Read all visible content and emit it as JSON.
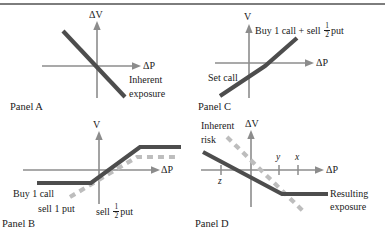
{
  "figure": {
    "kind": "option-payoff-diagram",
    "colors": {
      "axis": "#8c8c8c",
      "solid_line": "#4d4d4d",
      "dashed_line": "#bdbdbd",
      "text": "#1a1a1a",
      "rule": "#7d7d7d",
      "background": "#ffffff"
    },
    "top_rule": true
  },
  "panels": [
    {
      "id": "panel-a",
      "caption": "Panel A",
      "y_axis_label": "ΔV",
      "x_axis_label": "ΔP",
      "annotations": [
        {
          "name": "inherent-exposure",
          "line1": "Inherent",
          "line2": "exposure"
        }
      ],
      "curves": [
        {
          "name": "inherent-exposure-line",
          "style": "solid",
          "shape": "downward-sloping-straight"
        }
      ]
    },
    {
      "id": "panel-c",
      "caption": "Panel C",
      "y_axis_label": "V",
      "x_axis_label": "ΔP",
      "annotations": [
        {
          "name": "buy-call-sell-half-put",
          "prefix": "Buy 1 call + sell ",
          "fraction_num": "1",
          "fraction_den": "2",
          "suffix": "put"
        },
        {
          "name": "set-call",
          "text": "Set call"
        }
      ],
      "curves": [
        {
          "name": "payoff-line",
          "style": "solid",
          "shape": "kinked-upward"
        }
      ]
    },
    {
      "id": "panel-b",
      "caption": "Panel B",
      "y_axis_label": "V",
      "x_axis_label": "ΔP",
      "annotations": [
        {
          "name": "buy-1-call",
          "text": "Buy 1 call"
        },
        {
          "name": "sell-1-put",
          "text": "sell 1 put"
        },
        {
          "name": "sell-half-put",
          "prefix": "sell ",
          "fraction_num": "1",
          "fraction_den": "2",
          "suffix": "put"
        }
      ],
      "curves": [
        {
          "name": "solid-payoff-line",
          "style": "solid",
          "shape": "flat-rise-flat"
        },
        {
          "name": "dashed-payoff-line",
          "style": "dashed",
          "shape": "rising-then-flat"
        }
      ]
    },
    {
      "id": "panel-d",
      "caption": "Panel D",
      "y_axis_label": "ΔV",
      "x_axis_label": "ΔP",
      "annotations": [
        {
          "name": "inherent-risk",
          "line1": "Inherent",
          "line2": "risk"
        },
        {
          "name": "resulting-exposure",
          "line1": "Resulting",
          "line2": "exposure"
        }
      ],
      "ticks": [
        {
          "name": "tick-z",
          "label": "z",
          "position": "below-axis-left"
        },
        {
          "name": "tick-y",
          "label": "y",
          "position": "above-axis-right-inner"
        },
        {
          "name": "tick-x",
          "label": "x",
          "position": "above-axis-right-outer"
        }
      ],
      "curves": [
        {
          "name": "resulting-exposure-line",
          "style": "solid",
          "shape": "falling-then-flat"
        },
        {
          "name": "inherent-risk-line",
          "style": "dashed",
          "shape": "downward-sloping-straight"
        }
      ]
    }
  ]
}
